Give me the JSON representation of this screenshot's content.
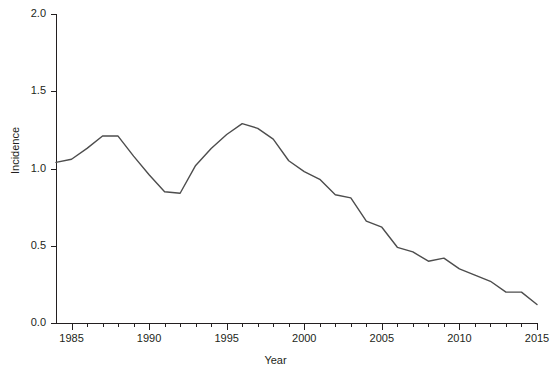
{
  "chart_data": {
    "type": "line",
    "title": "",
    "xlabel": "Year",
    "ylabel": "Incidence",
    "xlim": [
      1984,
      2015
    ],
    "ylim": [
      0.0,
      2.0
    ],
    "grid": false,
    "legend": "none",
    "x_major_ticks": [
      1985,
      1990,
      1995,
      2000,
      2005,
      2010,
      2015
    ],
    "x_major_tick_labels": [
      "1985",
      "1990",
      "1995",
      "2000",
      "2005",
      "2010",
      "2015"
    ],
    "x_minor_tick_step": 1,
    "y_ticks": [
      0.0,
      0.5,
      1.0,
      1.5,
      2.0
    ],
    "y_tick_labels": [
      "0.0",
      "0.5",
      "1.0",
      "1.5",
      "2.0"
    ],
    "series": [
      {
        "name": "Incidence",
        "color": "#4d4d4d",
        "x": [
          1984,
          1985,
          1986,
          1987,
          1988,
          1989,
          1990,
          1991,
          1992,
          1993,
          1994,
          1995,
          1996,
          1997,
          1998,
          1999,
          2000,
          2001,
          2002,
          2003,
          2004,
          2005,
          2006,
          2007,
          2008,
          2009,
          2010,
          2011,
          2012,
          2013,
          2014,
          2015
        ],
        "values": [
          1.04,
          1.06,
          1.13,
          1.21,
          1.21,
          1.08,
          0.96,
          0.85,
          0.84,
          1.02,
          1.13,
          1.22,
          1.29,
          1.26,
          1.19,
          1.05,
          0.98,
          0.93,
          0.83,
          0.81,
          0.66,
          0.62,
          0.49,
          0.46,
          0.4,
          0.42,
          0.35,
          0.31,
          0.27,
          0.2,
          0.2,
          0.12
        ]
      }
    ]
  },
  "axes": {
    "y_label": "Incidence",
    "x_label": "Year"
  }
}
